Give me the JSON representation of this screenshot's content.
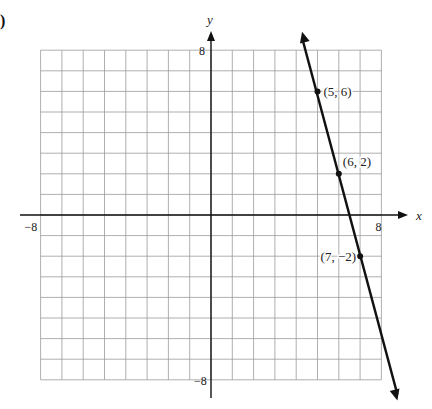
{
  "panel_label": ")",
  "chart_data": {
    "type": "line",
    "title": "",
    "xlabel": "x",
    "ylabel": "y",
    "xlim": [
      -8,
      8
    ],
    "ylim": [
      -8,
      8
    ],
    "grid": true,
    "tick_labels": {
      "x": [
        {
          "value": -8,
          "label": "−8"
        },
        {
          "value": 8,
          "label": "8"
        }
      ],
      "y": [
        {
          "value": 8,
          "label": "8"
        },
        {
          "value": -8,
          "label": "−8"
        }
      ]
    },
    "series": [
      {
        "name": "line",
        "equation": "y = -4x + 26",
        "points": [
          {
            "x": 5,
            "y": 6,
            "label": "(5, 6)"
          },
          {
            "x": 6,
            "y": 2,
            "label": "(6, 2)"
          },
          {
            "x": 7,
            "y": -2,
            "label": "(7, −2)"
          }
        ],
        "arrows": "both-ends",
        "color": "#111111"
      }
    ]
  }
}
